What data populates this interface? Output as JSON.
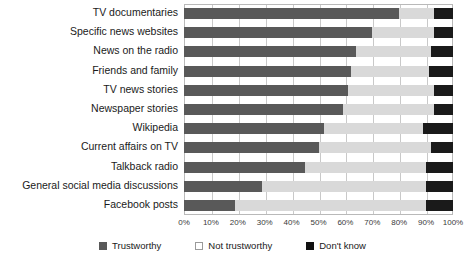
{
  "chart_data": {
    "type": "bar",
    "subtype": "stacked-horizontal-100",
    "title": "",
    "xlabel": "",
    "ylabel": "",
    "xlim": [
      0,
      100
    ],
    "xticks": [
      "0%",
      "10%",
      "20%",
      "30%",
      "40%",
      "50%",
      "60%",
      "70%",
      "80%",
      "90%",
      "100%"
    ],
    "xtick_values": [
      0,
      10,
      20,
      30,
      40,
      50,
      60,
      70,
      80,
      90,
      100
    ],
    "grid": true,
    "legend_position": "bottom-center",
    "categories": [
      "TV documentaries",
      "Specific news websites",
      "News on the radio",
      "Friends and family",
      "TV news stories",
      "Newspaper stories",
      "Wikipedia",
      "Current affairs on TV",
      "Talkback radio",
      "General social media discussions",
      "Facebook posts"
    ],
    "series": [
      {
        "name": "Trustworthy",
        "color": "#595959",
        "values": [
          80,
          70,
          64,
          62,
          61,
          59,
          52,
          50,
          45,
          29,
          19
        ]
      },
      {
        "name": "Not trustworthy",
        "color": "#d9d9d9",
        "values": [
          13,
          23,
          28,
          29,
          32,
          34,
          37,
          42,
          45,
          61,
          71
        ]
      },
      {
        "name": "Don't know",
        "color": "#1a1a1a",
        "values": [
          7,
          7,
          8,
          9,
          7,
          7,
          11,
          8,
          10,
          10,
          10
        ]
      }
    ]
  },
  "legend": {
    "items": [
      {
        "label": "Trustworthy"
      },
      {
        "label": "Not trustworthy"
      },
      {
        "label": "Don't know"
      }
    ]
  }
}
